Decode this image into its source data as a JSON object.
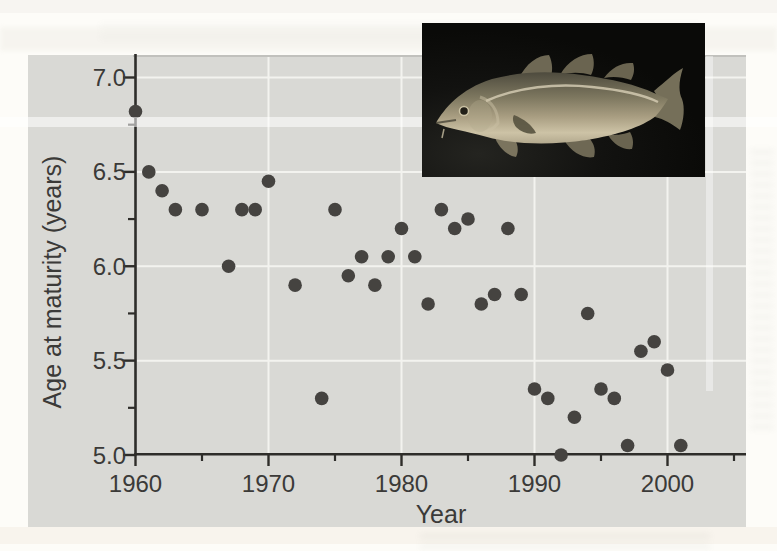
{
  "figure": {
    "kind": "textbook scatter-plot figure with photo inset"
  },
  "inset_photo": {
    "icon": "cod-photo",
    "subject": "Atlantic cod"
  },
  "colors": {
    "page_bg": "#fdfcf8",
    "panel_bg": "#d9d9d5",
    "grid": "#f3f3ef",
    "axis": "#2e2d2a",
    "dot": "#454340",
    "text": "#3b3a38",
    "photo_bg": "#0c0c0a"
  },
  "chart_data": {
    "type": "scatter",
    "title": "",
    "xlabel": "Year",
    "ylabel": "Age at maturity (years)",
    "xlim": [
      1960,
      2006
    ],
    "ylim": [
      5.0,
      7.1
    ],
    "grid": true,
    "legend": false,
    "x_ticks": [
      {
        "v": 1960,
        "label": "1960"
      },
      {
        "v": 1970,
        "label": "1970"
      },
      {
        "v": 1980,
        "label": "1980"
      },
      {
        "v": 1990,
        "label": "1990"
      },
      {
        "v": 2000,
        "label": "2000"
      }
    ],
    "x_minor_ticks": [
      1965,
      1975,
      1985,
      1995,
      2005
    ],
    "y_ticks": [
      {
        "v": 5.0,
        "label": "5.0"
      },
      {
        "v": 5.5,
        "label": "5.5"
      },
      {
        "v": 6.0,
        "label": "6.0"
      },
      {
        "v": 6.5,
        "label": "6.5"
      },
      {
        "v": 7.0,
        "label": "7.0"
      }
    ],
    "y_minor_ticks": [
      5.25,
      5.75,
      6.25,
      6.75
    ],
    "series": [
      {
        "name": "Age at maturity",
        "points": [
          [
            1960,
            6.82
          ],
          [
            1961,
            6.5
          ],
          [
            1962,
            6.4
          ],
          [
            1963,
            6.3
          ],
          [
            1965,
            6.3
          ],
          [
            1967,
            6.0
          ],
          [
            1968,
            6.3
          ],
          [
            1969,
            6.3
          ],
          [
            1970,
            6.45
          ],
          [
            1972,
            5.9
          ],
          [
            1974,
            5.3
          ],
          [
            1975,
            6.3
          ],
          [
            1976,
            5.95
          ],
          [
            1977,
            6.05
          ],
          [
            1978,
            5.9
          ],
          [
            1979,
            6.05
          ],
          [
            1980,
            6.2
          ],
          [
            1981,
            6.05
          ],
          [
            1982,
            5.8
          ],
          [
            1983,
            6.3
          ],
          [
            1984,
            6.2
          ],
          [
            1985,
            6.25
          ],
          [
            1986,
            5.8
          ],
          [
            1987,
            5.85
          ],
          [
            1988,
            6.2
          ],
          [
            1989,
            5.85
          ],
          [
            1990,
            5.35
          ],
          [
            1991,
            5.3
          ],
          [
            1992,
            5.0
          ],
          [
            1993,
            5.2
          ],
          [
            1994,
            5.75
          ],
          [
            1995,
            5.35
          ],
          [
            1996,
            5.3
          ],
          [
            1997,
            5.05
          ],
          [
            1998,
            5.55
          ],
          [
            1999,
            5.6
          ],
          [
            2000,
            5.45
          ],
          [
            2001,
            5.05
          ]
        ]
      }
    ]
  }
}
